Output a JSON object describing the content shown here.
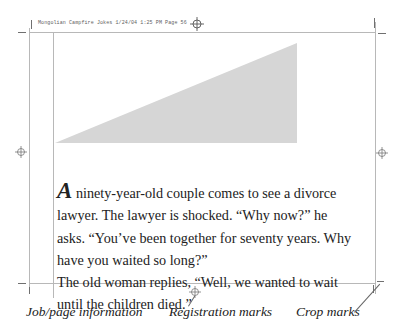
{
  "slug": {
    "text": "Mongolian Campfire Jokes 1/24/04  1:25 PM  Page 56"
  },
  "artwork": {
    "triangle_color": "#d6d6d6"
  },
  "story": {
    "drop_cap": "A",
    "lines": [
      " ninety-year-old couple comes to see a divorce",
      "lawyer. The lawyer is shocked. “Why now?” he",
      "asks. “You’ve been together for seventy years. Why",
      "have you waited so long?”",
      "The old woman replies, “Well, we wanted to wait",
      "until the children died.”"
    ]
  },
  "captions": {
    "job_page_information": "Job/page information",
    "registration_marks": "Registration marks",
    "crop_marks": "Crop marks"
  }
}
